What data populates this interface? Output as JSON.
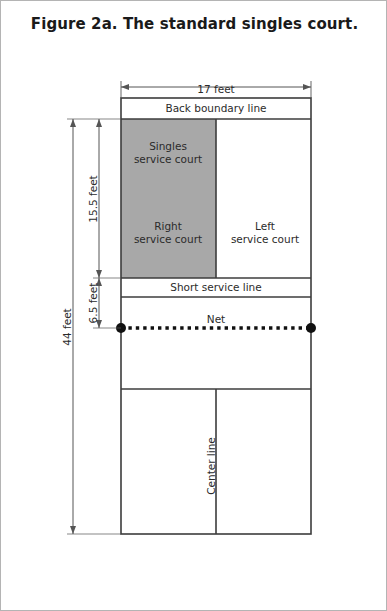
{
  "figure": {
    "title": "Figure 2a. The standard singles court."
  },
  "dimensions": {
    "width_label": "17 feet",
    "total_length_label": "44 feet",
    "rear_service_label": "15.5 feet",
    "front_service_label": "6.5 feet"
  },
  "court_labels": {
    "back_boundary": "Back boundary line",
    "singles_service_court": "Singles\nservice court",
    "singles_service_court_line1": "Singles",
    "singles_service_court_line2": "service court",
    "right_service_court_line1": "Right",
    "right_service_court_line2": "service court",
    "left_service_court_line1": "Left",
    "left_service_court_line2": "service court",
    "short_service_line": "Short service line",
    "net": "Net",
    "center_line": "Center line"
  },
  "colors": {
    "shaded_service_court": "#a8a8a8",
    "court_line": "#3c3c3c",
    "dimension_line": "#555555",
    "net_line": "#111111",
    "page_border": "#b4b4b4",
    "text": "#2b2b2b",
    "title_text": "#1a1a1a",
    "background": "#ffffff"
  },
  "geometry": {
    "court_left": 120,
    "court_right": 310,
    "back_boundary_top": 97,
    "service_court_top": 118,
    "short_service_line_y": 277,
    "net_y": 327,
    "far_short_service_line_y": 388,
    "court_bottom": 533,
    "center_line_x": 215,
    "dim_44_x": 72,
    "dim_inner_x": 98,
    "dim_17_y": 86
  }
}
